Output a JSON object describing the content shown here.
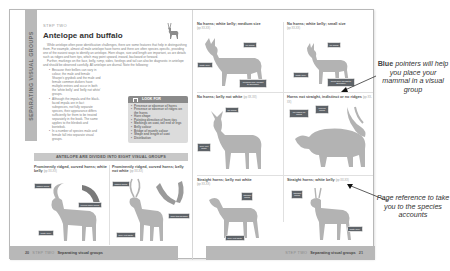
{
  "left_page": {
    "side_tab": "SEPARATING VISUAL GROUPS",
    "step_label": "STEP TWO",
    "title": "Antelope and buffalo",
    "intro_paragraphs": [
      "While antelope often pose identification challenges, there are some features that help in distinguishing them. For example, almost all male antelope have horns and there are often species-specific, providing one of the easiest ways to identify an antelope. Horn shape, size and length are important, as are details such as ridges and horn tips, which may point upward, inward, backward or forward.",
      "Further, markings on the face, belly, rump, sides, forelegs and tail can also be diagnostic in antelope and should be observed carefully. All antelope are diurnal. Note the following:"
    ],
    "bullets": [
      "Because their bellies can vary in colour, the male and female Sharpe's grysbok and the male and female common duikers have multiple entries and occur in both the 'white belly' and 'belly not white' groups.",
      "Although the impala and the black-faced impala are in fact subspecies, not fully separate species, their appearance differs sufficiently for them to be treated separately in the book. The same applies to the blesbok and bontebok.",
      "In a number of species male and female fall into separate visual groups."
    ],
    "look_for": {
      "heading": "LOOK FOR",
      "items": [
        "Presence or absence of horns",
        "Presence or absence of ridges on the horns",
        "Horn shape",
        "Pointing direction of horn tips",
        "Markings on coat, tail end or legs",
        "Belly colour",
        "Bridge of muzzle colour",
        "Shape and length of coat",
        "Distribution"
      ]
    },
    "groups_banner": "ANTELOPE ARE DIVIDED INTO EIGHT VISUAL GROUPS",
    "panels": [
      {
        "title": "Prominently ridged, curved horns; white belly",
        "ref": "(pp XX-XX)",
        "labels": [
          "ridged horns",
          "curved back horns",
          "white belly"
        ]
      },
      {
        "title": "Prominently ridged, curved horns; belly not white",
        "ref": "(pp XX-XX)",
        "labels": [
          "ridged horns",
          "horn tips forward",
          "belly not white"
        ]
      }
    ],
    "footer": {
      "page_number": "20",
      "step": "STEP TWO",
      "section": "Separating visual groups"
    }
  },
  "right_page": {
    "panels": [
      {
        "title": "No horns; white belly; medium size",
        "ref": "(pp XX-XX)",
        "labels": [
          "no horns",
          "white belly",
          "medium size (height to shoulder)"
        ]
      },
      {
        "title": "No horns; white belly; small size",
        "ref": "(pp XX-XX)",
        "labels": [
          "no horns",
          "white belly",
          "small size (height to shoulder)"
        ]
      },
      {
        "title": "No horns; belly not white",
        "ref": "(pp XX-XX)",
        "labels": [
          "no horns",
          "belly not white"
        ]
      },
      {
        "title": "Horns not straight, indistinct or no ridges",
        "ref": "(pp XX-XX)",
        "labels": [
          "no ridges on horns",
          "curved horns"
        ]
      },
      {
        "title": "Straight horns; belly not white",
        "ref": "(pp XX-XX)",
        "labels": [
          "straight horns",
          "belly not white"
        ]
      },
      {
        "title": "Straight horns; white belly",
        "ref": "(pp XX-XX)",
        "labels": [
          "straight horns",
          "white belly"
        ]
      }
    ],
    "footer": {
      "step": "STEP TWO",
      "section": "Separating visual groups",
      "page_number": "21"
    }
  },
  "annotations": {
    "blue_pointers": {
      "bold": "Blue",
      "rest": "pointers will help you place your mammal in a visual group"
    },
    "page_reference": "Page reference to take you to the species accounts"
  },
  "colors": {
    "silhouette": "#b3b3b3",
    "chip": "#5e6368",
    "footer": "#b8b8b8",
    "tab": "#b9b9b9"
  }
}
